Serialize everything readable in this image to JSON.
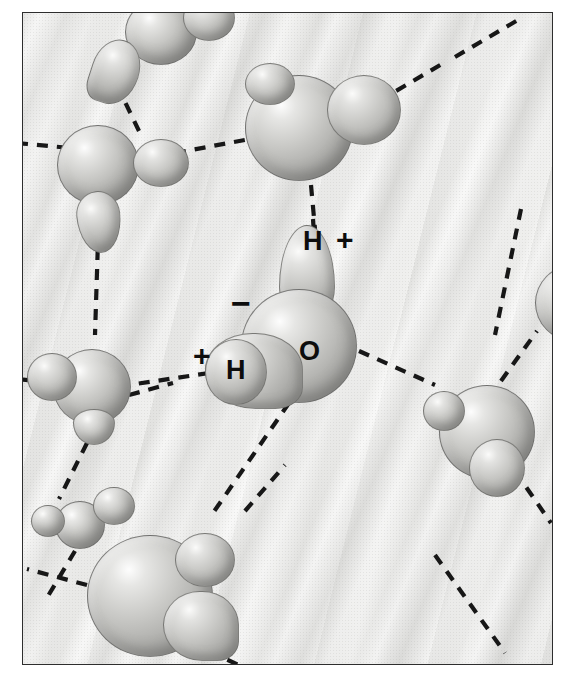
{
  "figure": {
    "medium": "grayscale airbrush illustration",
    "frame": {
      "x": 22,
      "y": 12,
      "width": 531,
      "height": 653,
      "border_color": "#2e2e2e"
    },
    "background_color": "#e8e8e6",
    "bond_color": "#171717",
    "atom_color": "#b4b4b1",
    "label_color": "#0d0d0d"
  },
  "labels": {
    "oxygen": "O",
    "hydrogen_top": "H",
    "hydrogen_left": "H",
    "charge_negative": "−",
    "charge_positive_top": "+",
    "charge_positive_left": "+"
  },
  "legend_notes": {
    "negative_meaning": "partial negative charge on oxygen",
    "positive_meaning": "partial positive charge on hydrogen",
    "dashed_line_meaning": "hydrogen bond"
  },
  "central_molecule": {
    "name": "central-water-molecule",
    "oxygen": {
      "cx": 298,
      "cy": 345,
      "r": 57
    },
    "hydrogens": [
      {
        "id": "hydrogen-top",
        "cx": 308,
        "cy": 246,
        "label": "H",
        "charge": "+"
      },
      {
        "id": "hydrogen-left",
        "cx": 238,
        "cy": 364,
        "label": "H",
        "charge": "+"
      }
    ]
  },
  "neighbor_molecules": [
    {
      "id": "molecule-top-left-corner",
      "cx": 146,
      "cy": 40
    },
    {
      "id": "molecule-upper-left",
      "cx": 94,
      "cy": 156
    },
    {
      "id": "molecule-top-center",
      "cx": 300,
      "cy": 118
    },
    {
      "id": "molecule-mid-left",
      "cx": 78,
      "cy": 398
    },
    {
      "id": "molecule-lower-left-small",
      "cx": 80,
      "cy": 513
    },
    {
      "id": "molecule-bottom-left-large",
      "cx": 148,
      "cy": 585
    },
    {
      "id": "molecule-right",
      "cx": 478,
      "cy": 428
    },
    {
      "id": "molecule-right-edge",
      "cx": 556,
      "cy": 300
    }
  ],
  "hydrogen_bonds": [
    {
      "id": "bond-central-to-top",
      "x1": 310,
      "y1": 228,
      "x2": 318,
      "y2": 182
    },
    {
      "id": "bond-central-to-right",
      "x1": 356,
      "y1": 350,
      "x2": 432,
      "y2": 382
    },
    {
      "id": "bond-central-to-bottom-left",
      "x1": 286,
      "y1": 402,
      "x2": 212,
      "y2": 510
    },
    {
      "id": "bond-central-to-left",
      "x1": 205,
      "y1": 372,
      "x2": 128,
      "y2": 382
    },
    {
      "id": "bond-upperleft-to-top",
      "x1": 136,
      "y1": 132,
      "x2": 110,
      "y2": 82
    },
    {
      "id": "bond-upperleft-to-left",
      "x1": 44,
      "y1": 142,
      "x2": 22,
      "y2": 136
    },
    {
      "id": "bond-upperleft-to-right",
      "x1": 176,
      "y1": 152,
      "x2": 258,
      "y2": 136
    },
    {
      "id": "bond-upperleft-to-down",
      "x1": 98,
      "y1": 210,
      "x2": 96,
      "y2": 330
    },
    {
      "id": "bond-topcenter-to-upper-right",
      "x1": 378,
      "y1": 100,
      "x2": 440,
      "y2": 62
    },
    {
      "id": "bond-midleft-to-right",
      "x1": 128,
      "y1": 392,
      "x2": 172,
      "y2": 382
    },
    {
      "id": "bond-midleft-to-bottom",
      "x1": 86,
      "y1": 440,
      "x2": 58,
      "y2": 494
    },
    {
      "id": "bond-lowerleft-to-bottom",
      "x1": 74,
      "y1": 548,
      "x2": 44,
      "y2": 596
    },
    {
      "id": "bond-bottomleft-to-left",
      "x1": 86,
      "y1": 582,
      "x2": 28,
      "y2": 566
    },
    {
      "id": "bond-bottomleft-to-bottom",
      "x1": 190,
      "y1": 640,
      "x2": 240,
      "y2": 662
    },
    {
      "id": "bond-right-to-upper",
      "x1": 498,
      "y1": 378,
      "x2": 534,
      "y2": 330
    },
    {
      "id": "bond-right-to-lower",
      "x1": 512,
      "y1": 468,
      "x2": 548,
      "y2": 520
    },
    {
      "id": "bond-rightedge-vertical",
      "x1": 518,
      "y1": 206,
      "x2": 494,
      "y2": 330
    },
    {
      "id": "bond-bottomright-diagonal",
      "x1": 432,
      "y1": 552,
      "x2": 500,
      "y2": 648
    }
  ]
}
